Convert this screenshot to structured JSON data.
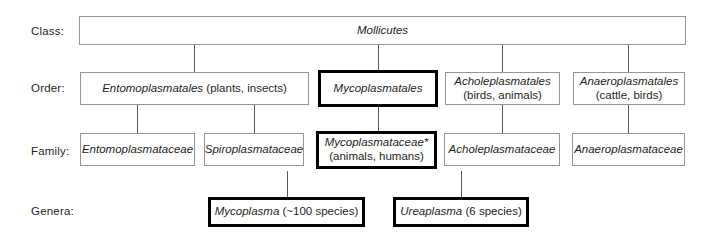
{
  "diagram": {
    "footnote_marker": "*",
    "rank_labels": {
      "class": "Class:",
      "order": "Order:",
      "family": "Family:",
      "genera": "Genera:"
    },
    "colors": {
      "text": "#231f20",
      "thin_border": "#939598",
      "bold_border": "#000000",
      "connector": "#58595b",
      "background": "#ffffff"
    },
    "class_row": [
      {
        "name": "Mollicutes",
        "detail": "",
        "highlighted": false
      }
    ],
    "order_row": [
      {
        "name": "Entomoplasmatales",
        "detail": "(plants, insects)",
        "detail_inline": true,
        "highlighted": false
      },
      {
        "name": "Mycoplasmatales",
        "detail": "",
        "detail_inline": false,
        "highlighted": true
      },
      {
        "name": "Acholeplasmatales",
        "detail": "(birds, animals)",
        "detail_inline": false,
        "highlighted": false
      },
      {
        "name": "Anaeroplasmatales",
        "detail": "(cattle, birds)",
        "detail_inline": false,
        "highlighted": false
      }
    ],
    "family_row": [
      {
        "name": "Entomoplasmataceae",
        "detail": "",
        "detail_inline": false,
        "highlighted": false
      },
      {
        "name": "Spiroplasmataceae",
        "detail": "",
        "detail_inline": false,
        "highlighted": false
      },
      {
        "name": "Mycoplasmataceae*",
        "detail": "(animals, humans)",
        "detail_inline": false,
        "highlighted": true
      },
      {
        "name": "Acholeplasmataceae",
        "detail": "",
        "detail_inline": false,
        "highlighted": false
      },
      {
        "name": "Anaeroplasmataceae",
        "detail": "",
        "detail_inline": false,
        "highlighted": false
      }
    ],
    "genera_row": [
      {
        "name": "Mycoplasma",
        "detail": "(~100 species)",
        "detail_inline": true,
        "highlighted": true
      },
      {
        "name": "Ureaplasma",
        "detail": "(6 species)",
        "detail_inline": true,
        "highlighted": true
      }
    ]
  }
}
